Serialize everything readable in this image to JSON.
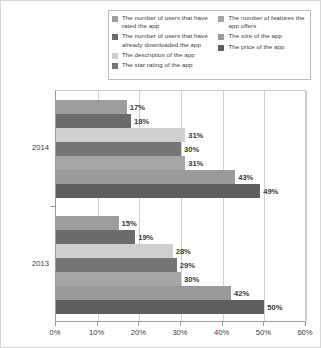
{
  "chart_data": {
    "type": "bar",
    "orientation": "horizontal",
    "title": "",
    "subtitle": "",
    "xlabel": "",
    "ylabel": "",
    "categories": [
      "2014",
      "2013"
    ],
    "xlim": [
      0,
      60
    ],
    "xticks": [
      0,
      10,
      20,
      30,
      40,
      50,
      60
    ],
    "xtick_labels": [
      "0%",
      "10%",
      "20%",
      "30%",
      "40%",
      "50%",
      "60%"
    ],
    "grid": true,
    "grid_axis": "x",
    "legend_position": "top-center",
    "value_labels": true,
    "value_label_suffix": "%",
    "series": [
      {
        "name": "The number of users that have rated the app",
        "color": "#9d9d9d",
        "values": [
          17,
          15
        ],
        "labels": [
          "17%",
          "15%"
        ]
      },
      {
        "name": "The number of users that have already downloaded the app",
        "color": "#6b6b6b",
        "values": [
          18,
          19
        ],
        "labels": [
          "18%",
          "19%"
        ]
      },
      {
        "name": "The description of the app",
        "color": "#cfcfcf",
        "values": [
          31,
          28
        ],
        "labels": [
          "31%",
          "28%"
        ]
      },
      {
        "name": "The star rating of the app",
        "color": "#767676",
        "values": [
          30,
          29
        ],
        "labels": [
          "30%",
          "29%"
        ]
      },
      {
        "name": "The number of features the app offers",
        "color": "#a6a6a6",
        "values": [
          31,
          30
        ],
        "labels": [
          "31%",
          "30%"
        ]
      },
      {
        "name": "The size of the app",
        "color": "#9a9a9a",
        "values": [
          43,
          42
        ],
        "labels": [
          "43%",
          "42%"
        ]
      },
      {
        "name": "The price of the app",
        "color": "#5e5e5e",
        "values": [
          49,
          50
        ],
        "labels": [
          "49%",
          "50%"
        ]
      }
    ]
  },
  "legend": {
    "left_column": [
      {
        "label": "The number of users that have rated the app",
        "color": "#9d9d9d",
        "swatch_name": "legend-swatch-users-rated"
      },
      {
        "label": "The number of users that have already downloaded the app",
        "color": "#6b6b6b",
        "swatch_name": "legend-swatch-users-downloaded"
      },
      {
        "label": "The description of the app",
        "color": "#cfcfcf",
        "swatch_name": "legend-swatch-description"
      },
      {
        "label": "The star rating of the app",
        "color": "#767676",
        "swatch_name": "legend-swatch-star-rating"
      }
    ],
    "right_column": [
      {
        "label": "The number of features the app offers",
        "color": "#a6a6a6",
        "swatch_name": "legend-swatch-features"
      },
      {
        "label": "The size of the app",
        "color": "#9a9a9a",
        "swatch_name": "legend-swatch-size"
      },
      {
        "label": "The price of the app",
        "color": "#5e5e5e",
        "swatch_name": "legend-swatch-price"
      }
    ]
  },
  "colors": {
    "frame": "#d8d8d8",
    "axis": "#9a9a9a",
    "gridline": "#cfcfcf",
    "text": "#3a3a3a",
    "background": "#ffffff"
  }
}
